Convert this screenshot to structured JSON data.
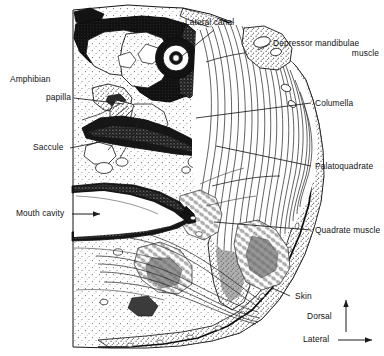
{
  "figure": {
    "colors": {
      "ink": "#121212",
      "bone_dark": "#151515",
      "stipple": "#4a4a4a",
      "paper": "#ffffff",
      "muscle_gray": "#6d6d6d"
    }
  },
  "labels": {
    "lateral_canal": "Lateral canal",
    "depressor_mandibulae_line1": "Depressor mandibulae",
    "depressor_mandibulae_line2": "muscle",
    "columella": "Columella",
    "palatoquadrate": "Palatoquadrate",
    "quadrate_muscle": "Quadrate muscle",
    "skin": "Skin",
    "amphibian_papilla_line1": "Amphibian",
    "amphibian_papilla_line2": "papilla",
    "saccule": "Saccule",
    "mouth_cavity": "Mouth cavity"
  },
  "orientation_key": {
    "dorsal": "Dorsal",
    "lateral": "Lateral"
  },
  "icons": {
    "leader_line": "leader-line-icon",
    "pointer_arrow": "arrow-right-icon",
    "dorsal_arrow": "arrow-up-icon",
    "lateral_arrow": "arrow-right-icon"
  }
}
